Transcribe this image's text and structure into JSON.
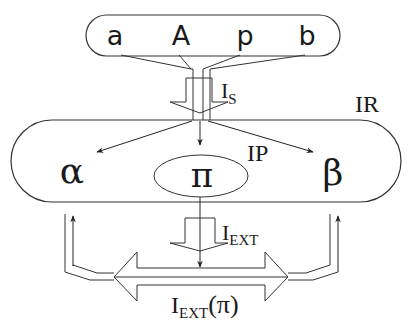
{
  "diagram": {
    "input_set": {
      "symbols": [
        "a",
        "A",
        "p",
        "b"
      ]
    },
    "labels": {
      "selection_interface": "I",
      "selection_interface_sub": "S",
      "ir": "IR",
      "ip": "IP",
      "ext_interface": "I",
      "ext_interface_sub": "EXT",
      "ext_output": "I",
      "ext_output_sub": "EXT",
      "ext_output_arg": "(π)"
    },
    "internal": {
      "alpha": "α",
      "pi": "π",
      "beta": "β"
    },
    "colors": {
      "stroke": "#333333",
      "text": "#1a1a1a",
      "background": "#ffffff"
    }
  }
}
